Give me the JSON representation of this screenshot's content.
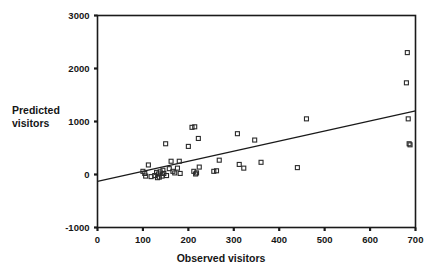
{
  "chart_data": {
    "type": "scatter",
    "title": "",
    "xlabel": "Observed visitors",
    "ylabel": "Predicted visitors",
    "xlim": [
      0,
      700
    ],
    "ylim": [
      -1000,
      3000
    ],
    "xticks": [
      0,
      100,
      200,
      300,
      400,
      500,
      600,
      700
    ],
    "yticks": [
      -1000,
      0,
      1000,
      2000,
      3000
    ],
    "xtick_labels": [
      "0",
      "100",
      "200",
      "300",
      "400",
      "500",
      "600",
      "700"
    ],
    "ytick_labels": [
      "-1000",
      "0",
      "1000",
      "2000",
      "3000"
    ],
    "grid": false,
    "legend": null,
    "marker": "open-square",
    "marker_color": "#2b2b2b",
    "line_color": "#1a1a1a",
    "frame": true,
    "series": [
      {
        "name": "Observed vs predicted visitors",
        "points": [
          [
            100,
            60
          ],
          [
            104,
            20
          ],
          [
            106,
            -30
          ],
          [
            112,
            180
          ],
          [
            118,
            -40
          ],
          [
            126,
            -20
          ],
          [
            130,
            40
          ],
          [
            132,
            -60
          ],
          [
            134,
            10
          ],
          [
            136,
            -50
          ],
          [
            138,
            50
          ],
          [
            142,
            -30
          ],
          [
            144,
            80
          ],
          [
            146,
            20
          ],
          [
            150,
            580
          ],
          [
            152,
            -20
          ],
          [
            158,
            110
          ],
          [
            162,
            250
          ],
          [
            166,
            60
          ],
          [
            170,
            30
          ],
          [
            176,
            120
          ],
          [
            180,
            250
          ],
          [
            182,
            20
          ],
          [
            200,
            530
          ],
          [
            208,
            890
          ],
          [
            212,
            60
          ],
          [
            214,
            900
          ],
          [
            216,
            10
          ],
          [
            218,
            30
          ],
          [
            222,
            680
          ],
          [
            224,
            140
          ],
          [
            256,
            60
          ],
          [
            262,
            70
          ],
          [
            268,
            270
          ],
          [
            308,
            770
          ],
          [
            312,
            190
          ],
          [
            322,
            120
          ],
          [
            346,
            650
          ],
          [
            360,
            230
          ],
          [
            440,
            130
          ],
          [
            460,
            1050
          ],
          [
            680,
            1730
          ],
          [
            682,
            2300
          ],
          [
            684,
            1050
          ],
          [
            686,
            580
          ],
          [
            688,
            560
          ]
        ]
      }
    ],
    "trendline": {
      "name": "regression line",
      "x_start": 0,
      "y_start": -130,
      "x_end": 700,
      "y_end": 1200
    }
  }
}
